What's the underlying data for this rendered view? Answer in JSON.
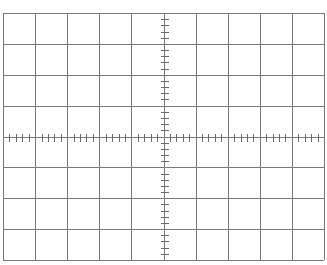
{
  "graticule": {
    "background": "#ffffff",
    "line_color": "#7a7a7a",
    "tick_color": "#6a6a6a",
    "left": 3,
    "top": 13,
    "right": 324,
    "bottom": 260,
    "h_divisions": 10,
    "v_divisions": 8,
    "minor_ticks_per_division": 5,
    "tick_length": 7
  }
}
